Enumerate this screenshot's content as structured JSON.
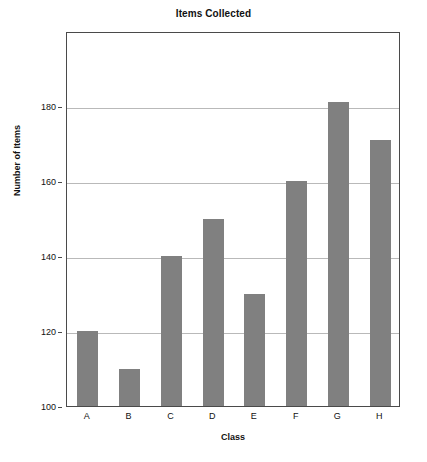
{
  "chart_data": {
    "type": "bar",
    "title": "Items Collected",
    "xlabel": "Class",
    "ylabel": "Number of Items",
    "categories": [
      "A",
      "B",
      "C",
      "D",
      "E",
      "F",
      "G",
      "H"
    ],
    "values": [
      120,
      110,
      140,
      150,
      130,
      160,
      181,
      171
    ],
    "series": [
      {
        "name": "Number of Items",
        "values": [
          120,
          110,
          140,
          150,
          130,
          160,
          181,
          171
        ]
      }
    ],
    "ylim": [
      100,
      200
    ],
    "xlim_categories": 8,
    "y_ticks": [
      100,
      120,
      140,
      160,
      180
    ],
    "y_tick_labels": [
      "100",
      "120",
      "140",
      "160",
      "180"
    ],
    "grid": "horizontal",
    "legend": "none",
    "bar_color": "#808080",
    "grid_color": "#b9b9b9",
    "axis_color": "#4a4a4a",
    "background": "#ffffff"
  }
}
